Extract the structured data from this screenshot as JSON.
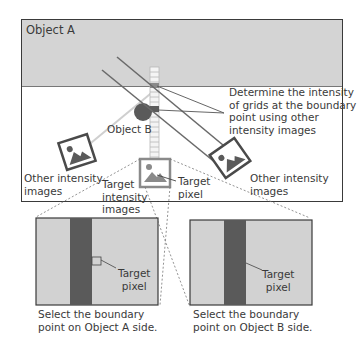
{
  "labels": {
    "object_a": "Object A",
    "object_b": "Object B",
    "determine_note": [
      "Determine the intensity",
      "of grids at the boundary",
      "point using other",
      "intensity images"
    ],
    "other_left": [
      "Other intensity",
      "images"
    ],
    "other_right": [
      "Other intensity",
      "images"
    ],
    "target_images": [
      "Target",
      "intensity",
      "images"
    ],
    "target_pixel_top": [
      "Target",
      "pixel"
    ],
    "panel_left_target": [
      "Target",
      "pixel"
    ],
    "panel_right_target": [
      "Target",
      "pixel"
    ],
    "caption_left": [
      "Select the boundary",
      "point on Object A side."
    ],
    "caption_right": [
      "Select the boundary",
      "point on Object B side."
    ]
  },
  "colors": {
    "object_a_fill": "#d4d4d4",
    "frame_stroke": "#3a3a3a",
    "dark_band": "#5a5a5a",
    "panel_fill": "#d2d2d2",
    "object_b_fill": "#5a5a5a",
    "ray_stroke": "#6a6a6a",
    "light_ray": "#cfcfcf"
  }
}
